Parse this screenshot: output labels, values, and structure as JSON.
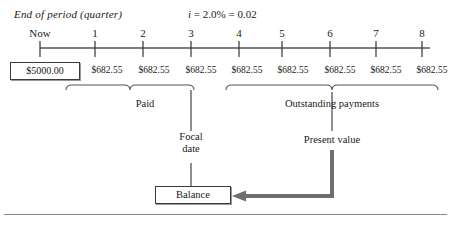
{
  "diagram": {
    "header_note": "End of period (quarter)",
    "rate_symbol": "i",
    "rate_text": " = 2.0% = 0.02",
    "rate_full": "i = 2.0% = 0.02",
    "now_label": "Now",
    "period_labels": [
      "1",
      "2",
      "3",
      "4",
      "5",
      "6",
      "7",
      "8"
    ],
    "principal_box": "$5000.00",
    "payments": [
      "$682.55",
      "$682.55",
      "$682.55",
      "$682.55",
      "$682.55",
      "$682.55",
      "$682.55",
      "$682.55"
    ],
    "paid_brace_label": "Paid",
    "outstanding_brace_label": "Outstanding payments",
    "focal_date_label_line1": "Focal",
    "focal_date_label_line2": "date",
    "present_value_label": "Present value",
    "balance_box": "Balance",
    "colors": {
      "line": "#1a1a1a",
      "axis": "#555555",
      "arrow": "#6e6e6e",
      "box_border": "#3a3a3a",
      "box_shadow": "#9a9a9a",
      "rule": "#8a8a8a"
    }
  }
}
